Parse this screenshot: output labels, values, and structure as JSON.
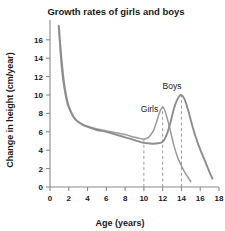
{
  "chart_data": {
    "type": "line",
    "title": "Growth rates of girls and boys",
    "xlabel": "Age (years)",
    "ylabel": "Change in height (cm/year)",
    "xlim": [
      0,
      18
    ],
    "ylim": [
      0,
      17.5
    ],
    "xticks": [
      0,
      2,
      4,
      6,
      8,
      10,
      12,
      14,
      16,
      18
    ],
    "yticks": [
      0,
      2,
      4,
      6,
      8,
      10,
      12,
      14,
      16
    ],
    "grid": false,
    "legend": "inline-labels",
    "annotations": [
      {
        "text": "Girls",
        "x": 10.6,
        "y": 8.2
      },
      {
        "text": "Boys",
        "x": 13.0,
        "y": 10.6
      }
    ],
    "guide_lines": [
      {
        "x": 10,
        "label": "10"
      },
      {
        "x": 12,
        "label": "12"
      },
      {
        "x": 14,
        "label": "14"
      }
    ],
    "series": [
      {
        "name": "Girls",
        "color": "#9a9a9a",
        "peak_age": 12,
        "peak_value": 8.7,
        "x": [
          0.9,
          1.0,
          1.1,
          1.3,
          1.5,
          1.8,
          2.0,
          2.5,
          3.0,
          3.5,
          4.0,
          5.0,
          6.0,
          7.0,
          8.0,
          9.0,
          9.5,
          10.0,
          10.5,
          11.0,
          11.3,
          11.6,
          11.8,
          12.0,
          12.2,
          12.5,
          12.8,
          13.2,
          13.6,
          14.0,
          14.4,
          14.8,
          15.0
        ],
        "y": [
          17.5,
          16.2,
          14.6,
          12.3,
          10.8,
          9.2,
          8.6,
          7.6,
          7.1,
          6.8,
          6.6,
          6.3,
          6.1,
          5.9,
          5.7,
          5.4,
          5.3,
          5.2,
          5.4,
          6.1,
          6.9,
          7.9,
          8.4,
          8.7,
          8.4,
          7.4,
          6.2,
          4.5,
          3.2,
          2.3,
          1.5,
          0.9,
          0.6
        ]
      },
      {
        "name": "Boys",
        "color": "#8d8d8d",
        "peak_age": 14,
        "peak_value": 10.0,
        "x": [
          0.95,
          1.05,
          1.2,
          1.4,
          1.6,
          1.9,
          2.1,
          2.6,
          3.1,
          3.6,
          4.1,
          5.0,
          6.0,
          7.0,
          8.0,
          9.0,
          10.0,
          10.5,
          11.0,
          11.5,
          12.0,
          12.4,
          12.8,
          13.2,
          13.5,
          13.8,
          14.0,
          14.3,
          14.7,
          15.2,
          15.8,
          16.4,
          17.0,
          17.3
        ],
        "y": [
          17.5,
          16.0,
          14.2,
          12.1,
          10.6,
          9.1,
          8.5,
          7.5,
          7.0,
          6.7,
          6.5,
          6.2,
          6.0,
          5.7,
          5.4,
          5.1,
          4.8,
          4.75,
          4.7,
          4.75,
          4.9,
          5.6,
          6.9,
          8.5,
          9.4,
          9.9,
          10.0,
          9.6,
          8.4,
          6.5,
          4.6,
          3.1,
          1.6,
          0.9
        ]
      }
    ]
  },
  "colors": {
    "girls": "#9a9a9a",
    "boys": "#8d8d8d",
    "axis": "#8a8a8a",
    "text": "#1a1a1a",
    "guide": "#9a9a9a",
    "background": "#ffffff"
  }
}
